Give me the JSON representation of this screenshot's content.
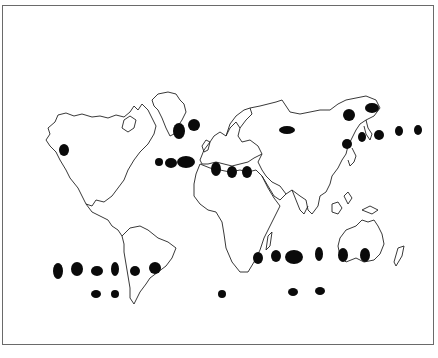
{
  "map": {
    "type": "world-outline-distribution-map",
    "frame_color": "#6a6a6a",
    "coast_color": "#222222",
    "marker_color": "#0a0a0a",
    "text_labels": [],
    "markers": [
      {
        "id": "alaska",
        "cx": 64,
        "cy": 150,
        "rx": 5,
        "ry": 6
      },
      {
        "id": "greenland-south-1",
        "cx": 179,
        "cy": 131,
        "rx": 6,
        "ry": 8
      },
      {
        "id": "greenland-south-2",
        "cx": 194,
        "cy": 125,
        "rx": 6,
        "ry": 6
      },
      {
        "id": "north-atlantic-1",
        "cx": 159,
        "cy": 162,
        "rx": 4,
        "ry": 4
      },
      {
        "id": "north-atlantic-2",
        "cx": 171,
        "cy": 163,
        "rx": 6,
        "ry": 5
      },
      {
        "id": "north-atlantic-3",
        "cx": 186,
        "cy": 162,
        "rx": 9,
        "ry": 6
      },
      {
        "id": "mediterranean-1",
        "cx": 216,
        "cy": 169,
        "rx": 5,
        "ry": 7
      },
      {
        "id": "mediterranean-2",
        "cx": 232,
        "cy": 172,
        "rx": 5,
        "ry": 6
      },
      {
        "id": "mediterranean-3",
        "cx": 247,
        "cy": 172,
        "rx": 5,
        "ry": 6
      },
      {
        "id": "siberia",
        "cx": 287,
        "cy": 130,
        "rx": 8,
        "ry": 4
      },
      {
        "id": "kamchatka-1",
        "cx": 349,
        "cy": 115,
        "rx": 6,
        "ry": 6
      },
      {
        "id": "kamchatka-2",
        "cx": 372,
        "cy": 108,
        "rx": 7,
        "ry": 5
      },
      {
        "id": "japan",
        "cx": 347,
        "cy": 144,
        "rx": 5,
        "ry": 5
      },
      {
        "id": "nw-pacific-1",
        "cx": 362,
        "cy": 137,
        "rx": 4,
        "ry": 5
      },
      {
        "id": "nw-pacific-2",
        "cx": 379,
        "cy": 135,
        "rx": 5,
        "ry": 5
      },
      {
        "id": "nw-pacific-3",
        "cx": 399,
        "cy": 131,
        "rx": 4,
        "ry": 5
      },
      {
        "id": "nw-pacific-4",
        "cx": 418,
        "cy": 130,
        "rx": 4,
        "ry": 5
      },
      {
        "id": "south-pacific-1",
        "cx": 58,
        "cy": 271,
        "rx": 5,
        "ry": 8
      },
      {
        "id": "south-pacific-2",
        "cx": 77,
        "cy": 269,
        "rx": 6,
        "ry": 7
      },
      {
        "id": "south-pacific-3",
        "cx": 97,
        "cy": 271,
        "rx": 6,
        "ry": 5
      },
      {
        "id": "south-pacific-4",
        "cx": 115,
        "cy": 269,
        "rx": 4,
        "ry": 7
      },
      {
        "id": "chile",
        "cx": 135,
        "cy": 271,
        "rx": 5,
        "ry": 5
      },
      {
        "id": "argentina-atlantic",
        "cx": 155,
        "cy": 268,
        "rx": 6,
        "ry": 6
      },
      {
        "id": "south-africa",
        "cx": 258,
        "cy": 258,
        "rx": 5,
        "ry": 6
      },
      {
        "id": "south-indian-1",
        "cx": 276,
        "cy": 256,
        "rx": 5,
        "ry": 6
      },
      {
        "id": "south-indian-2",
        "cx": 294,
        "cy": 257,
        "rx": 9,
        "ry": 7
      },
      {
        "id": "south-indian-3",
        "cx": 319,
        "cy": 254,
        "rx": 4,
        "ry": 7
      },
      {
        "id": "west-australia",
        "cx": 343,
        "cy": 255,
        "rx": 5,
        "ry": 7
      },
      {
        "id": "south-australia",
        "cx": 365,
        "cy": 255,
        "rx": 5,
        "ry": 7
      },
      {
        "id": "southern-ocean-1",
        "cx": 96,
        "cy": 294,
        "rx": 5,
        "ry": 4
      },
      {
        "id": "southern-ocean-2",
        "cx": 115,
        "cy": 294,
        "rx": 4,
        "ry": 4
      },
      {
        "id": "southern-ocean-3",
        "cx": 222,
        "cy": 294,
        "rx": 4,
        "ry": 4
      },
      {
        "id": "southern-ocean-4",
        "cx": 293,
        "cy": 292,
        "rx": 5,
        "ry": 4
      },
      {
        "id": "southern-ocean-5",
        "cx": 320,
        "cy": 291,
        "rx": 5,
        "ry": 4
      }
    ]
  }
}
